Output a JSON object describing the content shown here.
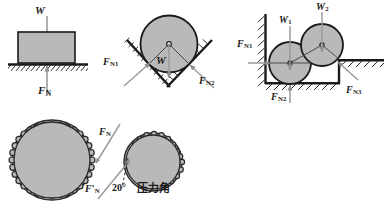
{
  "figure": {
    "background": "#ffffff",
    "body_fill": "#b9b9b9",
    "body_stroke": "#1a1a1a",
    "arrow_gray": "#9b9b9b",
    "hatch_color": "#2a2a2a"
  },
  "panels": [
    {
      "id": "block-on-ground",
      "name": "block-on-horizontal-surface",
      "labels": [
        {
          "id": "w",
          "symbol": "W",
          "sub": "",
          "x": 35,
          "y": 6,
          "size": 11
        },
        {
          "id": "fn",
          "symbol": "F",
          "sub": "N",
          "x": 39,
          "y": 86,
          "size": 11
        }
      ]
    },
    {
      "id": "cylinder-in-vee",
      "name": "cylinder-in-v-groove",
      "labels": [
        {
          "id": "fn1",
          "symbol": "F",
          "sub": "N1",
          "x": 104,
          "y": 58,
          "size": 10
        },
        {
          "id": "w",
          "symbol": "W",
          "sub": "",
          "x": 158,
          "y": 57,
          "size": 11
        },
        {
          "id": "fn2",
          "symbol": "F",
          "sub": "N2",
          "x": 200,
          "y": 78,
          "size": 10
        }
      ]
    },
    {
      "id": "two-cylinders-in-corner",
      "name": "two-cylinders-in-corner",
      "labels": [
        {
          "id": "fn1",
          "symbol": "F",
          "sub": "N1",
          "x": 238,
          "y": 40,
          "size": 10
        },
        {
          "id": "w1",
          "symbol": "W",
          "sub": "1",
          "x": 280,
          "y": 16,
          "size": 10
        },
        {
          "id": "w2",
          "symbol": "W",
          "sub": "2",
          "x": 318,
          "y": 3,
          "size": 10
        },
        {
          "id": "fn2",
          "symbol": "F",
          "sub": "N2",
          "x": 272,
          "y": 93,
          "size": 10
        },
        {
          "id": "fn3",
          "symbol": "F",
          "sub": "N3",
          "x": 347,
          "y": 86,
          "size": 10
        }
      ]
    },
    {
      "id": "gear-pair",
      "name": "gear-pressure-angle",
      "labels": [
        {
          "id": "fn",
          "symbol": "F",
          "sub": "N",
          "x": 100,
          "y": 128,
          "size": 10
        },
        {
          "id": "fn-prime",
          "symbol": "F",
          "sub": "N",
          "prime": "'",
          "x": 86,
          "y": 185,
          "size": 10
        }
      ],
      "angle_label": {
        "text": "20°",
        "x": 113,
        "y": 183,
        "size": 10
      },
      "chinese_label": {
        "text": "压力角",
        "x": 137,
        "y": 184,
        "size": 11
      }
    }
  ],
  "text_values": {
    "W": "W",
    "F": "F",
    "sub_N": "N",
    "sub_N1": "N1",
    "sub_N2": "N2",
    "sub_N3": "N3",
    "sub_1": "1",
    "sub_2": "2",
    "prime": "'",
    "angle": "20°",
    "pressure_angle_cn": "压力角"
  }
}
